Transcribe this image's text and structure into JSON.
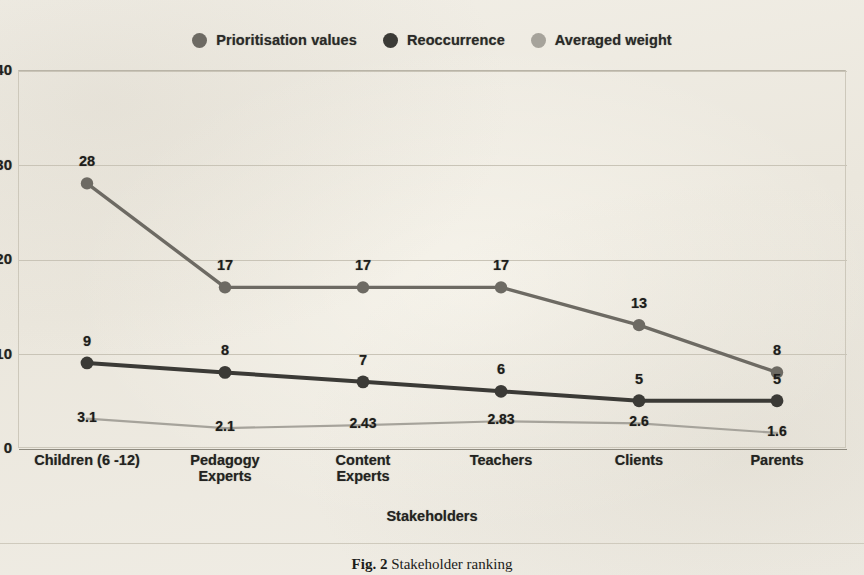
{
  "figure": {
    "caption_label": "Fig. 2",
    "caption_text": "Stakeholder ranking"
  },
  "legend": {
    "position": "top-center",
    "items": [
      {
        "label": "Prioritisation values",
        "color": "#6d6a63",
        "icon": "circle-marker-icon"
      },
      {
        "label": "Reoccurrence",
        "color": "#3b3a36",
        "icon": "circle-marker-icon"
      },
      {
        "label": "Averaged weight",
        "color": "#a6a39b",
        "icon": "circle-marker-icon"
      }
    ]
  },
  "axes": {
    "y_ticks": [
      "40",
      "30",
      "20",
      "10",
      "0"
    ],
    "x_title": "Stakeholders"
  },
  "chart_data": {
    "type": "line",
    "title": "",
    "xlabel": "Stakeholders",
    "ylabel": "",
    "ylim": [
      0,
      40
    ],
    "yticks": [
      0,
      10,
      20,
      30,
      40
    ],
    "grid": true,
    "legend_position": "top-center",
    "categories": [
      "Children (6 -12)",
      "Pedagogy\nExperts",
      "Content\nExperts",
      "Teachers",
      "Clients",
      "Parents"
    ],
    "series": [
      {
        "name": "Prioritisation values",
        "color": "#6d6a63",
        "values": [
          28,
          17,
          17,
          17,
          13,
          8
        ],
        "labels": [
          "28",
          "17",
          "17",
          "17",
          "13",
          "8"
        ]
      },
      {
        "name": "Reoccurrence",
        "color": "#3b3a36",
        "values": [
          9,
          8,
          7,
          6,
          5,
          5
        ],
        "labels": [
          "9",
          "8",
          "7",
          "6",
          "5",
          "5"
        ]
      },
      {
        "name": "Averaged weight",
        "color": "#a6a39b",
        "values": [
          3.1,
          2.1,
          2.43,
          2.83,
          2.6,
          1.6
        ],
        "labels": [
          "3.1",
          "2.1",
          "2.43",
          "2.83",
          "2.6",
          "1.6"
        ]
      }
    ]
  }
}
